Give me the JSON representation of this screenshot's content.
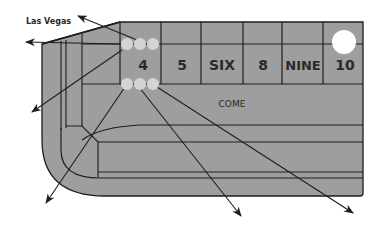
{
  "diagram": {
    "title_label": "Las Vegas",
    "colors": {
      "felt": "#9e9e9e",
      "line": "#1e1e1e",
      "marker": "#d4d4d4",
      "puck": "#ffffff",
      "background": "#ffffff"
    },
    "place_numbers": [
      {
        "label": "4"
      },
      {
        "label": "5"
      },
      {
        "label": "SIX"
      },
      {
        "label": "8"
      },
      {
        "label": "NINE"
      },
      {
        "label": "10"
      }
    ],
    "come_label": "COME",
    "markers": {
      "upper_row_count": 3,
      "lower_row_count": 3,
      "puck_on": "10"
    },
    "arrows_count": 6
  }
}
